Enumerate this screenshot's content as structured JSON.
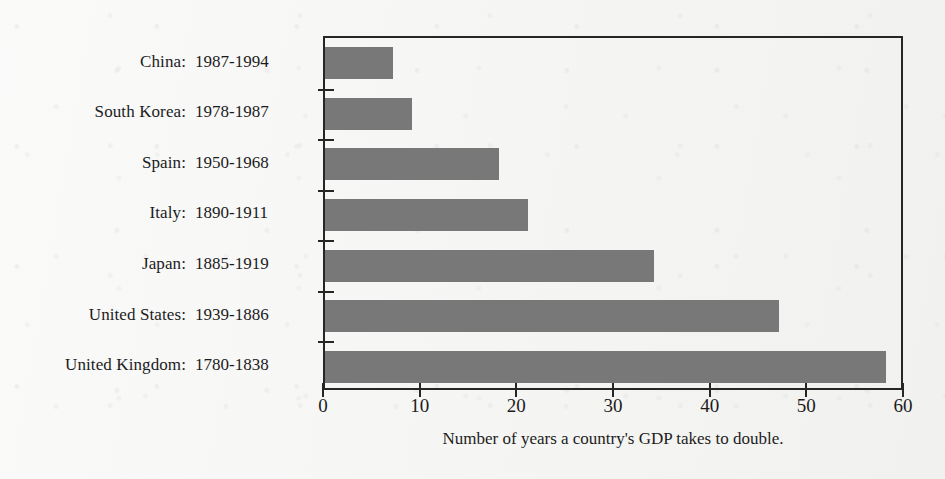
{
  "chart_data": {
    "type": "bar",
    "orientation": "horizontal",
    "title": "",
    "xlabel": "Number of years a country's GDP takes to double.",
    "ylabel": "",
    "xlim": [
      0,
      60
    ],
    "xticks": [
      0,
      10,
      20,
      30,
      40,
      50,
      60
    ],
    "xticklabels": [
      "0",
      "10",
      "20",
      "30",
      "40",
      "50",
      "60"
    ],
    "grid": false,
    "legend": null,
    "bar_color": "#787878",
    "axis_color": "#262626",
    "categories": [
      "China: 1987-1994",
      "South Korea: 1978-1987",
      "Spain: 1950-1968",
      "Italy: 1890-1911",
      "Japan: 1885-1919",
      "United States: 1939-1886",
      "United Kingdom: 1780-1838"
    ],
    "values": [
      7,
      9,
      18,
      21,
      34,
      47,
      58
    ],
    "points": [
      {
        "country": "China",
        "years": "1987-1994",
        "value": 7
      },
      {
        "country": "South Korea",
        "years": "1978-1987",
        "value": 9
      },
      {
        "country": "Spain",
        "years": "1950-1968",
        "value": 18
      },
      {
        "country": "Italy",
        "years": "1890-1911",
        "value": 21
      },
      {
        "country": "Japan",
        "years": "1885-1919",
        "value": 34
      },
      {
        "country": "United States",
        "years": "1939-1886",
        "value": 47
      },
      {
        "country": "United Kingdom",
        "years": "1780-1838",
        "value": 58
      }
    ]
  },
  "labels": {
    "rows": [
      {
        "name": "China:",
        "years": "1987-1994"
      },
      {
        "name": "South Korea:",
        "years": "1978-1987"
      },
      {
        "name": "Spain:",
        "years": "1950-1968"
      },
      {
        "name": "Italy:",
        "years": "1890-1911"
      },
      {
        "name": "Japan:",
        "years": "1885-1919"
      },
      {
        "name": "United States:",
        "years": "1939-1886"
      },
      {
        "name": "United Kingdom:",
        "years": "1780-1838"
      }
    ]
  },
  "axis": {
    "x_title": "Number of years a country's GDP takes to double.",
    "x_ticklabels": [
      "0",
      "10",
      "20",
      "30",
      "40",
      "50",
      "60"
    ]
  }
}
